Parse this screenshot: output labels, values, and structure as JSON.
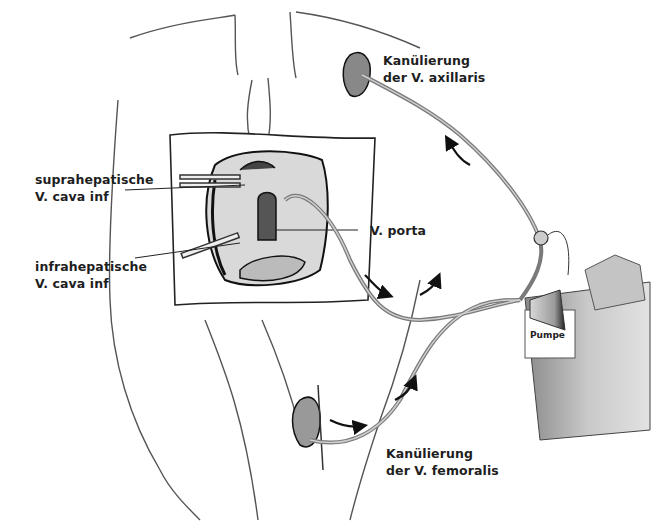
{
  "labels": {
    "axillaris": [
      "Kanülierung",
      "der V. axillaris"
    ],
    "suprahepatisch": [
      "suprahepatische",
      "V. cava inf"
    ],
    "infrahepatisch": [
      "infrahepatische",
      "V. cava inf"
    ],
    "porta": "V. porta",
    "pumpe": "Pumpe",
    "femoralis": [
      "Kanülierung",
      "der V. femoralis"
    ]
  },
  "colors": {
    "ink": "#1e1e1e",
    "tube": "#9a9a9a",
    "shade": "#8c8c8c",
    "pump_body": "#bdbdbd"
  }
}
